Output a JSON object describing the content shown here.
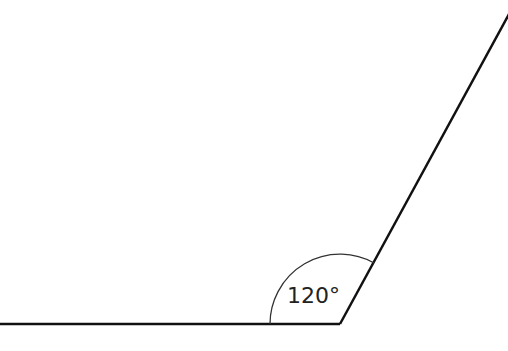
{
  "diagram": {
    "type": "angle",
    "angle_label": "120°",
    "angle_degrees": 120,
    "stroke_color": "#111111",
    "background": "#ffffff"
  }
}
